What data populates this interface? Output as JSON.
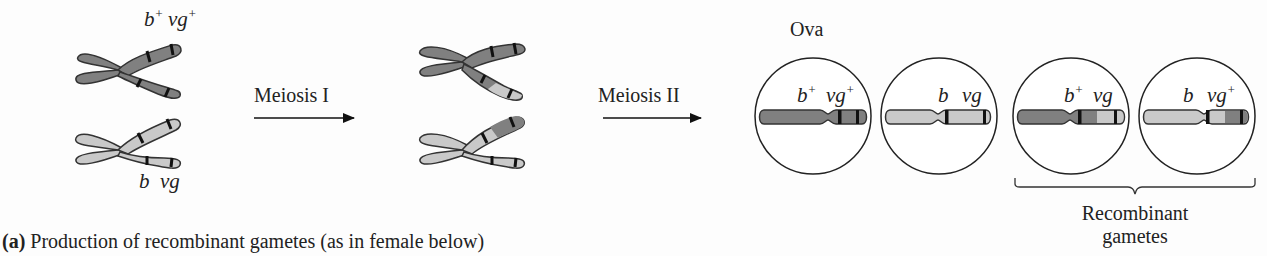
{
  "figure": {
    "caption_prefix": "(a)",
    "caption_text": " Production of recombinant gametes (as in female below)"
  },
  "steps": {
    "meiosis1_label": "Meiosis I",
    "meiosis2_label": "Meiosis II"
  },
  "parent_chromosomes": {
    "top": {
      "allele1": "b",
      "allele1_sup": "+",
      "allele2": "vg",
      "allele2_sup": "+",
      "color": "#808080"
    },
    "bottom": {
      "allele1": "b",
      "allele2": "vg",
      "color": "#c9c9c9"
    }
  },
  "ova": {
    "title": "Ova",
    "cells": [
      {
        "b": "b",
        "b_sup": "+",
        "vg": "vg",
        "vg_sup": "+",
        "type": "parental"
      },
      {
        "b": "b",
        "b_sup": "",
        "vg": "vg",
        "vg_sup": "",
        "type": "parental"
      },
      {
        "b": "b",
        "b_sup": "+",
        "vg": "vg",
        "vg_sup": "",
        "type": "recombinant"
      },
      {
        "b": "b",
        "b_sup": "",
        "vg": "vg",
        "vg_sup": "+",
        "type": "recombinant"
      }
    ],
    "recombinant_label_line1": "Recombinant",
    "recombinant_label_line2": "gametes"
  },
  "colors": {
    "dark_chromosome": "#808080",
    "light_chromosome": "#c8c8c8",
    "band": "#111111",
    "outline": "#333333"
  }
}
